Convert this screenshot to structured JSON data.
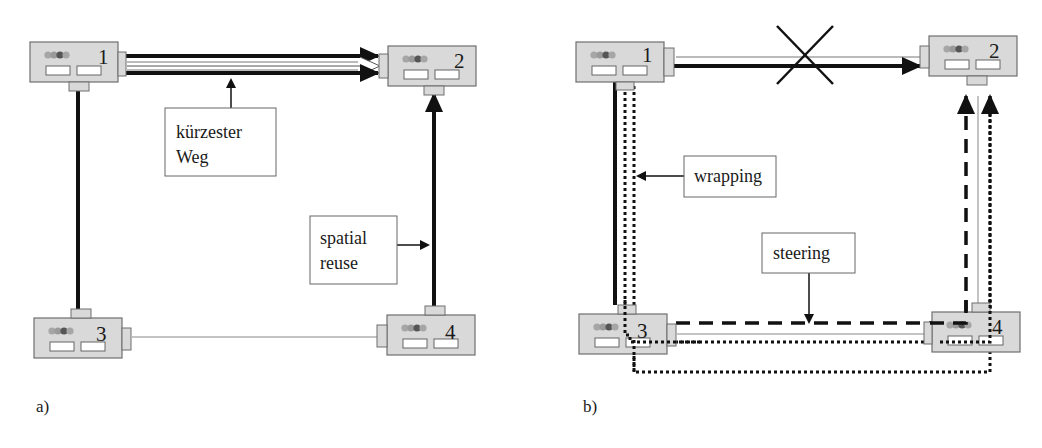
{
  "figure": {
    "panels": [
      {
        "id": "a",
        "label": "a)",
        "nodes": [
          {
            "id": "1",
            "label": "1"
          },
          {
            "id": "2",
            "label": "2"
          },
          {
            "id": "3",
            "label": "3"
          },
          {
            "id": "4",
            "label": "4"
          }
        ],
        "annotations": [
          {
            "id": "shortest-path",
            "line1": "kürzester",
            "line2": "Weg"
          },
          {
            "id": "spatial-reuse",
            "line1": "spatial",
            "line2": "reuse"
          }
        ]
      },
      {
        "id": "b",
        "label": "b)",
        "nodes": [
          {
            "id": "1",
            "label": "1"
          },
          {
            "id": "2",
            "label": "2"
          },
          {
            "id": "3",
            "label": "3"
          },
          {
            "id": "4",
            "label": "4"
          }
        ],
        "annotations": [
          {
            "id": "wrapping",
            "line1": "wrapping"
          },
          {
            "id": "steering",
            "line1": "steering"
          }
        ],
        "failure_marker": "X"
      }
    ],
    "colors": {
      "node_fill": "#d9d9d9",
      "node_border": "#6e6e6e",
      "line": "#111111",
      "thin_line": "#777777"
    }
  }
}
